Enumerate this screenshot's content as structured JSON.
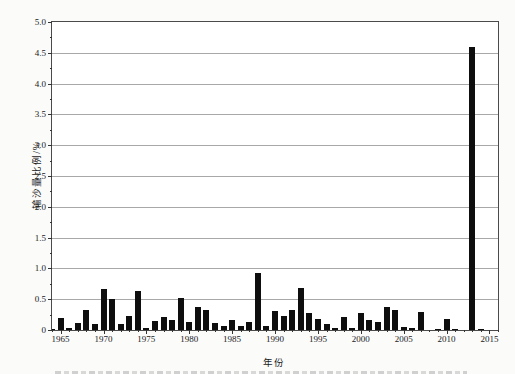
{
  "chart_data": {
    "type": "bar",
    "title": "",
    "xlabel": "年份",
    "ylabel": "输沙量比例/%",
    "legend": "none",
    "grid": "horizontal, every 0.5",
    "bar_color": "#0e0e0e",
    "ylim": [
      0,
      5
    ],
    "y_tick_step": 0.5,
    "y_minor_tick_step": 0.25,
    "y_tick_labels": [
      "0",
      "0.5",
      "1.0",
      "1.5",
      "2.0",
      "2.5",
      "3.0",
      "3.5",
      "4.0",
      "4.5",
      "5.0"
    ],
    "x_domain": [
      1964,
      2016
    ],
    "x_labeled_ticks": [
      1965,
      1970,
      1975,
      1980,
      1985,
      1990,
      1995,
      2000,
      2005,
      2010,
      2015
    ],
    "x_minor_tick_every_year": true,
    "series": [
      {
        "name": "输沙量比例",
        "x": [
          1964,
          1965,
          1966,
          1967,
          1968,
          1969,
          1970,
          1971,
          1972,
          1973,
          1974,
          1975,
          1976,
          1977,
          1978,
          1979,
          1980,
          1981,
          1982,
          1983,
          1984,
          1985,
          1986,
          1987,
          1988,
          1989,
          1990,
          1991,
          1992,
          1993,
          1994,
          1995,
          1996,
          1997,
          1998,
          1999,
          2000,
          2001,
          2002,
          2003,
          2004,
          2005,
          2006,
          2007,
          2008,
          2009,
          2010,
          2011,
          2012,
          2013,
          2014,
          2015
        ],
        "values": [
          0.02,
          0.2,
          0.04,
          0.11,
          0.32,
          0.1,
          0.66,
          0.5,
          0.09,
          0.23,
          0.64,
          0.04,
          0.15,
          0.21,
          0.16,
          0.52,
          0.13,
          0.37,
          0.33,
          0.12,
          0.07,
          0.17,
          0.06,
          0.13,
          0.92,
          0.06,
          0.31,
          0.22,
          0.33,
          0.68,
          0.27,
          0.18,
          0.1,
          0.03,
          0.21,
          0.03,
          0.27,
          0.17,
          0.13,
          0.38,
          0.33,
          0.05,
          0.03,
          0.29,
          0.0,
          0.01,
          0.18,
          0.02,
          0.0,
          4.6,
          0.02,
          0.0
        ]
      }
    ]
  }
}
